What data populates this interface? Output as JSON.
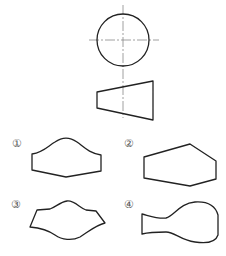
{
  "figure": {
    "given_views": {
      "top_view": {
        "shape": "circle",
        "has_centerlines": true
      },
      "front_view": {
        "shape": "trapezoid"
      }
    },
    "options": [
      {
        "label": "①",
        "shape": "dome-top with flat sides and shallow V bottom"
      },
      {
        "label": "②",
        "shape": "irregular hexagon"
      },
      {
        "label": "③",
        "shape": "wavy top and curved bottom"
      },
      {
        "label": "④",
        "shape": "bottle / bulb shape"
      }
    ]
  },
  "colors": {
    "stroke": "#222222",
    "centerline": "#888888",
    "label": "#555555",
    "background": "#ffffff"
  }
}
